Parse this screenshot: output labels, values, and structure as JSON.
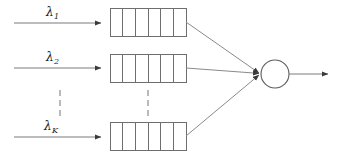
{
  "figure": {
    "type": "queueing-system-diagram",
    "width": 340,
    "height": 160,
    "background_color": "#ffffff",
    "line_color": "#6e6e6e",
    "text_color": "#1c1c1c"
  },
  "arrivals": [
    {
      "id": "arrival-1",
      "symbol": "λ",
      "subscript": "1",
      "label_x": 46,
      "label_y": 6,
      "arrow_y": 23,
      "arrow_x1": 14,
      "arrow_x2": 101
    },
    {
      "id": "arrival-2",
      "symbol": "λ",
      "subscript": "2",
      "label_x": 46,
      "label_y": 51,
      "arrow_y": 68,
      "arrow_x1": 14,
      "arrow_x2": 101
    },
    {
      "id": "arrival-k",
      "symbol": "λ",
      "subscript": "K",
      "label_x": 44,
      "label_y": 120,
      "arrow_y": 137,
      "arrow_x1": 14,
      "arrow_x2": 101
    }
  ],
  "queues": [
    {
      "id": "queue-1",
      "x": 110,
      "y": 8,
      "width": 76,
      "height": 28,
      "cells": 6
    },
    {
      "id": "queue-2",
      "x": 110,
      "y": 54,
      "width": 76,
      "height": 28,
      "cells": 6
    },
    {
      "id": "queue-k",
      "x": 110,
      "y": 122,
      "width": 76,
      "height": 28,
      "cells": 6
    }
  ],
  "ellipses": [
    {
      "id": "ellipsis-arrivals",
      "x": 60,
      "y_start": 90,
      "y_end": 116,
      "dots": 3,
      "orientation": "vertical"
    },
    {
      "id": "ellipsis-queues",
      "x": 148,
      "y_start": 90,
      "y_end": 116,
      "dots": 3,
      "orientation": "vertical"
    }
  ],
  "server": {
    "id": "server-node",
    "cx": 275,
    "cy": 74,
    "r": 14,
    "shape": "circle"
  },
  "feed_lines": [
    {
      "id": "feed-line-1",
      "x1": 186,
      "y1": 22,
      "x2": 261,
      "y2": 74
    },
    {
      "id": "feed-line-2",
      "x1": 186,
      "y1": 68,
      "x2": 261,
      "y2": 74
    },
    {
      "id": "feed-line-k",
      "x1": 186,
      "y1": 136,
      "x2": 261,
      "y2": 74
    }
  ],
  "departure": {
    "id": "departure-arrow",
    "x1": 289,
    "x2": 328,
    "y": 74
  }
}
